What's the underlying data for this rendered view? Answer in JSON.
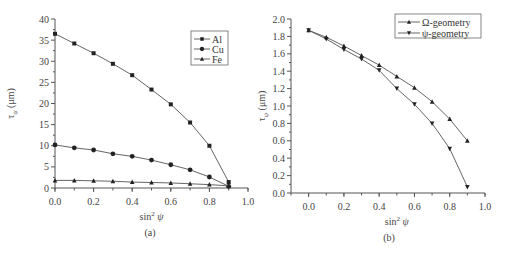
{
  "chart_data": [
    {
      "panel": "(a)",
      "type": "line",
      "xlabel": "sin² ψ",
      "ylabel": "τψ (μm)",
      "xlim": [
        0.0,
        1.0
      ],
      "ylim": [
        0,
        40
      ],
      "xticks": [
        "0.0",
        "0.2",
        "0.4",
        "0.6",
        "0.8",
        "1.0"
      ],
      "yticks": [
        "0",
        "5",
        "10",
        "15",
        "20",
        "25",
        "30",
        "35",
        "40"
      ],
      "grid": false,
      "legend_position": "upper right",
      "x": [
        0.0,
        0.1,
        0.2,
        0.3,
        0.4,
        0.5,
        0.6,
        0.7,
        0.8,
        0.9
      ],
      "series": [
        {
          "name": "Al",
          "marker": "square",
          "values": [
            36.5,
            34.2,
            31.9,
            29.4,
            26.7,
            23.3,
            19.8,
            15.5,
            10.0,
            1.4
          ]
        },
        {
          "name": "Cu",
          "marker": "circle",
          "values": [
            10.2,
            9.5,
            9.0,
            8.1,
            7.5,
            6.6,
            5.5,
            4.3,
            2.6,
            0.4
          ]
        },
        {
          "name": "Fe",
          "marker": "triangle-up",
          "values": [
            1.8,
            1.8,
            1.7,
            1.6,
            1.4,
            1.3,
            1.2,
            1.0,
            0.8,
            0.5
          ]
        }
      ]
    },
    {
      "panel": "(b)",
      "type": "line",
      "xlabel": "sin² ψ",
      "ylabel": "τψ (μm)",
      "xlim": [
        -0.1,
        1.0
      ],
      "ylim": [
        0.0,
        2.0
      ],
      "xticks": [
        "0.0",
        "0.2",
        "0.4",
        "0.6",
        "0.8",
        "1.0"
      ],
      "yticks": [
        "0.0",
        "0.2",
        "0.4",
        "0.6",
        "0.8",
        "1.0",
        "1.2",
        "1.4",
        "1.6",
        "1.8",
        "2.0"
      ],
      "grid": false,
      "legend_position": "upper right",
      "x": [
        0.0,
        0.1,
        0.2,
        0.3,
        0.4,
        0.5,
        0.6,
        0.7,
        0.8,
        0.9
      ],
      "series": [
        {
          "name": "Ω-geometry",
          "marker": "triangle-up",
          "values": [
            1.87,
            1.79,
            1.69,
            1.58,
            1.47,
            1.34,
            1.21,
            1.05,
            0.85,
            0.6
          ]
        },
        {
          "name": "ψ-geometry",
          "marker": "triangle-down",
          "values": [
            1.87,
            1.77,
            1.65,
            1.54,
            1.41,
            1.2,
            1.02,
            0.8,
            0.51,
            0.07
          ]
        }
      ]
    }
  ],
  "figure": {
    "panel_a_caption": "(a)",
    "panel_b_caption": "(b)",
    "xlabel_text": "sin",
    "xlabel_sup": "2",
    "xlabel_var": "ψ",
    "ylabel_tau": "τ",
    "ylabel_sub": "ψ",
    "ylabel_unit": " (μm)"
  }
}
